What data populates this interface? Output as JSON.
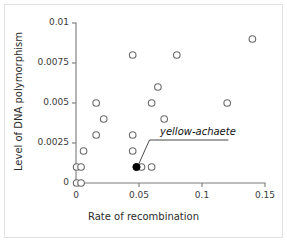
{
  "chart_data": {
    "type": "scatter",
    "title": "",
    "xlabel": "Rate of recombination",
    "ylabel": "Level of DNA polymorphism",
    "xlim": [
      0,
      0.15
    ],
    "ylim": [
      0,
      0.01
    ],
    "xticks": [
      "0",
      "0.05",
      "0.1",
      "0.15"
    ],
    "xtick_values": [
      0,
      0.05,
      0.1,
      0.15
    ],
    "yticks": [
      "0",
      "0.0025",
      "0.005",
      "0.0075",
      "0.01"
    ],
    "ytick_values": [
      0,
      0.0025,
      0.005,
      0.0075,
      0.01
    ],
    "grid": false,
    "legend": null,
    "series": [
      {
        "name": "genes",
        "marker": "open-circle",
        "points": [
          {
            "x": 0.0005,
            "y": 0.0
          },
          {
            "x": 0.004,
            "y": 0.0
          },
          {
            "x": 0.0005,
            "y": 0.001
          },
          {
            "x": 0.004,
            "y": 0.001
          },
          {
            "x": 0.006,
            "y": 0.002
          },
          {
            "x": 0.016,
            "y": 0.003
          },
          {
            "x": 0.016,
            "y": 0.005
          },
          {
            "x": 0.022,
            "y": 0.004
          },
          {
            "x": 0.045,
            "y": 0.008
          },
          {
            "x": 0.045,
            "y": 0.003
          },
          {
            "x": 0.045,
            "y": 0.002
          },
          {
            "x": 0.052,
            "y": 0.001
          },
          {
            "x": 0.06,
            "y": 0.001
          },
          {
            "x": 0.06,
            "y": 0.005
          },
          {
            "x": 0.065,
            "y": 0.006
          },
          {
            "x": 0.07,
            "y": 0.004
          },
          {
            "x": 0.08,
            "y": 0.008
          },
          {
            "x": 0.12,
            "y": 0.005
          },
          {
            "x": 0.14,
            "y": 0.009
          }
        ]
      },
      {
        "name": "yellow-achaete",
        "marker": "filled-circle",
        "points": [
          {
            "x": 0.048,
            "y": 0.001
          }
        ]
      }
    ],
    "annotations": [
      {
        "text": "yellow-achaete",
        "target_x": 0.048,
        "target_y": 0.001
      }
    ]
  },
  "axes": {
    "x_title": "Rate of recombination",
    "y_title": "Level of DNA polymorphism"
  }
}
